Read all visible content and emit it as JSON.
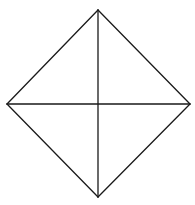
{
  "figure": {
    "type": "diamond-with-diagonals",
    "width": 195,
    "height": 205,
    "background": "#ffffff",
    "stroke_color": "#1a1a1a",
    "stroke_width": 1.3,
    "vertices": {
      "top": [
        98,
        10
      ],
      "right": [
        190,
        104
      ],
      "bottom": [
        98,
        197
      ],
      "left": [
        7,
        104
      ]
    },
    "center": [
      98,
      104
    ],
    "segments": [
      {
        "name": "edge-top-right",
        "from": "top",
        "to": "right"
      },
      {
        "name": "edge-right-bottom",
        "from": "right",
        "to": "bottom"
      },
      {
        "name": "edge-bottom-left",
        "from": "bottom",
        "to": "left"
      },
      {
        "name": "edge-left-top",
        "from": "left",
        "to": "top"
      },
      {
        "name": "diagonal-vertical",
        "from": "top",
        "to": "bottom"
      },
      {
        "name": "diagonal-horizontal",
        "from": "left",
        "to": "right"
      }
    ]
  }
}
